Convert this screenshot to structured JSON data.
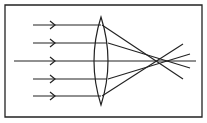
{
  "diagram": {
    "colors": {
      "stroke": "#222222",
      "background": "#ffffff"
    },
    "frame": {
      "x": 5,
      "y": 5,
      "width": 197,
      "height": 112
    },
    "lens": {
      "type": "biconvex",
      "cx": 101,
      "top": 17,
      "bottom": 105,
      "half_width": 7
    },
    "optical_axis": {
      "y": 61,
      "x_start": 14,
      "x_end": 196
    },
    "incident_rays": [
      {
        "y": 25,
        "x_start": 33,
        "arrow_x": 55
      },
      {
        "y": 43,
        "x_start": 33,
        "arrow_x": 55
      },
      {
        "y": 61,
        "x_start": 14,
        "arrow_x": 55
      },
      {
        "y": 79,
        "x_start": 33,
        "arrow_x": 55
      },
      {
        "y": 96,
        "x_start": 33,
        "arrow_x": 55
      }
    ],
    "refracted_rays": [
      {
        "from": [
          102,
          25
        ],
        "to": [
          183,
          79
        ]
      },
      {
        "from": [
          108,
          43
        ],
        "to": [
          190,
          68
        ]
      },
      {
        "from": [
          108,
          79
        ],
        "to": [
          190,
          54
        ]
      },
      {
        "from": [
          102,
          96
        ],
        "to": [
          183,
          44
        ]
      }
    ]
  }
}
